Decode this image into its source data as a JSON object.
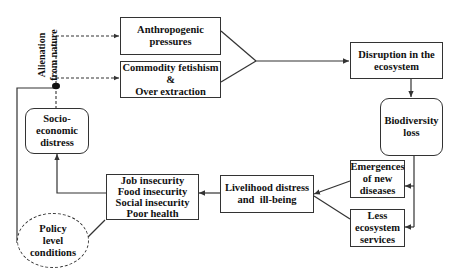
{
  "diagram": {
    "nodes": {
      "anthropogenic": {
        "lines": [
          "Anthropogenic",
          "pressures"
        ]
      },
      "commodity": {
        "lines": [
          "Commodity fetishism &",
          "Over extraction"
        ]
      },
      "disruption": {
        "lines": [
          "Disruption in the",
          "ecosystem"
        ]
      },
      "biodiversity": {
        "lines": [
          "Biodiversity",
          "loss"
        ]
      },
      "diseases": {
        "lines": [
          "Emergences",
          "of new",
          "diseases"
        ]
      },
      "ecosystem_services": {
        "lines": [
          "Less",
          "ecosystem",
          "services"
        ]
      },
      "livelihood": {
        "lines": [
          "Livelihood distress",
          "and  ill-being"
        ]
      },
      "insecurity": {
        "lines": [
          "Job insecurity",
          "Food insecurity",
          "Social insecurity",
          "Poor health"
        ]
      },
      "socio_economic": {
        "lines": [
          "Socio-",
          "economic",
          "distress"
        ]
      },
      "policy": {
        "lines": [
          "Policy",
          "level",
          "conditions"
        ]
      }
    },
    "edge_label": {
      "lines": [
        "Alienation",
        "from nature"
      ]
    },
    "colors": {
      "line": "#333333",
      "background": "#ffffff"
    }
  }
}
